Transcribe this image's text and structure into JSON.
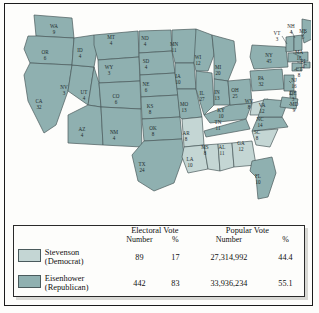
{
  "legend": {
    "group_headers": {
      "electoral": "Electoral Vote",
      "popular": "Popular Vote"
    },
    "sub_headers": {
      "number": "Number",
      "percent": "%"
    },
    "rows": [
      {
        "candidate": "Stevenson",
        "party": "(Democrat)",
        "swatch": "dem",
        "color": "#c4d6d4",
        "electoral_number": "89",
        "electoral_percent": "17",
        "popular_number": "27,314,992",
        "popular_percent": "44.4"
      },
      {
        "candidate": "Eisenhower",
        "party": "(Republican)",
        "swatch": "rep",
        "color": "#8fb0b0",
        "electoral_number": "442",
        "electoral_percent": "83",
        "popular_number": "33,936,234",
        "popular_percent": "55.1"
      }
    ]
  },
  "chart_data": {
    "type": "map",
    "legend_position": "bottom",
    "colors": {
      "democrat": "#c4d6d4",
      "republican": "#8fb0b0"
    },
    "totals": {
      "electoral_votes": {
        "Stevenson": 89,
        "Eisenhower": 442
      },
      "electoral_percent": {
        "Stevenson": 17,
        "Eisenhower": 83
      },
      "popular_votes": {
        "Stevenson": 27314992,
        "Eisenhower": 33936234
      },
      "popular_percent": {
        "Stevenson": 44.4,
        "Eisenhower": 55.1
      }
    },
    "states": [
      {
        "code": "WA",
        "votes": 9,
        "winner": "Eisenhower",
        "x": 48,
        "y": 22
      },
      {
        "code": "OR",
        "votes": 6,
        "winner": "Eisenhower",
        "x": 39,
        "y": 48
      },
      {
        "code": "CA",
        "votes": 32,
        "winner": "Eisenhower",
        "x": 33,
        "y": 97
      },
      {
        "code": "NV",
        "votes": 3,
        "winner": "Eisenhower",
        "x": 58,
        "y": 83
      },
      {
        "code": "ID",
        "votes": 4,
        "winner": "Eisenhower",
        "x": 74,
        "y": 46
      },
      {
        "code": "MT",
        "votes": 4,
        "winner": "Eisenhower",
        "x": 105,
        "y": 33
      },
      {
        "code": "WY",
        "votes": 3,
        "winner": "Eisenhower",
        "x": 103,
        "y": 63
      },
      {
        "code": "UT",
        "votes": 4,
        "winner": "Eisenhower",
        "x": 78,
        "y": 88
      },
      {
        "code": "CO",
        "votes": 6,
        "winner": "Eisenhower",
        "x": 110,
        "y": 92
      },
      {
        "code": "AZ",
        "votes": 4,
        "winner": "Eisenhower",
        "x": 76,
        "y": 125
      },
      {
        "code": "NM",
        "votes": 4,
        "winner": "Eisenhower",
        "x": 108,
        "y": 128
      },
      {
        "code": "ND",
        "votes": 4,
        "winner": "Eisenhower",
        "x": 139,
        "y": 34
      },
      {
        "code": "SD",
        "votes": 4,
        "winner": "Eisenhower",
        "x": 140,
        "y": 57
      },
      {
        "code": "NE",
        "votes": 6,
        "winner": "Eisenhower",
        "x": 140,
        "y": 80
      },
      {
        "code": "KS",
        "votes": 8,
        "winner": "Eisenhower",
        "x": 144,
        "y": 102
      },
      {
        "code": "OK",
        "votes": 8,
        "winner": "Eisenhower",
        "x": 147,
        "y": 124
      },
      {
        "code": "TX",
        "votes": 24,
        "winner": "Eisenhower",
        "x": 136,
        "y": 160
      },
      {
        "code": "MN",
        "votes": 11,
        "winner": "Eisenhower",
        "x": 168,
        "y": 40
      },
      {
        "code": "IA",
        "votes": 10,
        "winner": "Eisenhower",
        "x": 172,
        "y": 72
      },
      {
        "code": "MO",
        "votes": 13,
        "winner": "Eisenhower",
        "x": 178,
        "y": 100
      },
      {
        "code": "AR",
        "votes": 8,
        "winner": "Stevenson",
        "x": 180,
        "y": 129
      },
      {
        "code": "LA",
        "votes": 10,
        "winner": "Stevenson",
        "x": 184,
        "y": 155
      },
      {
        "code": "WI",
        "votes": 12,
        "winner": "Eisenhower",
        "x": 192,
        "y": 53
      },
      {
        "code": "IL",
        "votes": 27,
        "winner": "Eisenhower",
        "x": 196,
        "y": 89
      },
      {
        "code": "MS",
        "votes": 8,
        "winner": "Stevenson",
        "x": 199,
        "y": 143
      },
      {
        "code": "MI",
        "votes": 20,
        "winner": "Eisenhower",
        "x": 212,
        "y": 63
      },
      {
        "code": "IN",
        "votes": 13,
        "winner": "Eisenhower",
        "x": 211,
        "y": 88
      },
      {
        "code": "KY",
        "votes": 10,
        "winner": "Eisenhower",
        "x": 215,
        "y": 106
      },
      {
        "code": "TN",
        "votes": 11,
        "winner": "Eisenhower",
        "x": 212,
        "y": 118
      },
      {
        "code": "AL",
        "votes": 11,
        "winner": "Stevenson",
        "x": 216,
        "y": 143
      },
      {
        "code": "OH",
        "votes": 25,
        "winner": "Eisenhower",
        "x": 229,
        "y": 86
      },
      {
        "code": "GA",
        "votes": 12,
        "winner": "Stevenson",
        "x": 235,
        "y": 139
      },
      {
        "code": "FL",
        "votes": 10,
        "winner": "Eisenhower",
        "x": 252,
        "y": 172
      },
      {
        "code": "WV",
        "votes": 8,
        "winner": "Stevenson",
        "x": 243,
        "y": 97
      },
      {
        "code": "SC",
        "votes": 8,
        "winner": "Stevenson",
        "x": 251,
        "y": 128
      },
      {
        "code": "NC",
        "votes": 14,
        "winner": "Eisenhower",
        "x": 254,
        "y": 115
      },
      {
        "code": "VA",
        "votes": 12,
        "winner": "Eisenhower",
        "x": 256,
        "y": 101
      },
      {
        "code": "PA",
        "votes": 32,
        "winner": "Eisenhower",
        "x": 255,
        "y": 74
      },
      {
        "code": "NY",
        "votes": 45,
        "winner": "Eisenhower",
        "x": 263,
        "y": 51
      },
      {
        "code": "VT",
        "votes": 3,
        "winner": "Eisenhower",
        "x": 271,
        "y": 29
      },
      {
        "code": "NH",
        "votes": 4,
        "winner": "Eisenhower",
        "x": 285,
        "y": 22
      },
      {
        "code": "ME",
        "votes": 5,
        "winner": "Eisenhower",
        "x": 297,
        "y": 27
      },
      {
        "code": "MA",
        "votes": 16,
        "winner": "Eisenhower",
        "x": 293,
        "y": 48
      },
      {
        "code": "RI",
        "votes": 4,
        "winner": "Eisenhower",
        "x": 297,
        "y": 57
      },
      {
        "code": "CT",
        "votes": 8,
        "winner": "Eisenhower",
        "x": 293,
        "y": 65
      },
      {
        "code": "NJ",
        "votes": 16,
        "winner": "Eisenhower",
        "x": 288,
        "y": 76
      },
      {
        "code": "DE",
        "votes": 3,
        "winner": "Eisenhower",
        "x": 287,
        "y": 89
      },
      {
        "code": "MD",
        "votes": 9,
        "winner": "Eisenhower",
        "x": 288,
        "y": 100
      }
    ]
  }
}
